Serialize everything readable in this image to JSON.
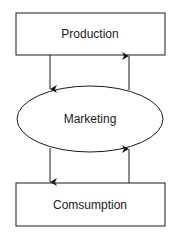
{
  "diagram": {
    "nodes": [
      {
        "id": "production",
        "label": "Production",
        "shape": "rectangle"
      },
      {
        "id": "marketing",
        "label": "Marketing",
        "shape": "ellipse"
      },
      {
        "id": "consumption",
        "label": "Comsumption",
        "shape": "rectangle"
      }
    ],
    "edges": [
      {
        "from": "production",
        "to": "marketing"
      },
      {
        "from": "marketing",
        "to": "production"
      },
      {
        "from": "marketing",
        "to": "consumption"
      },
      {
        "from": "consumption",
        "to": "marketing"
      }
    ],
    "colors": {
      "stroke": "#1a1a1a",
      "background": "#ffffff"
    }
  }
}
